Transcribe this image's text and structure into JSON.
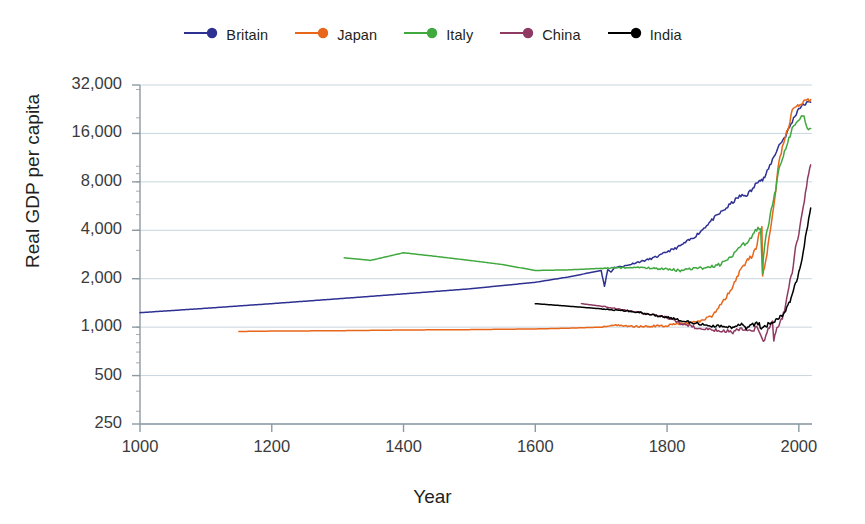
{
  "chart_data": {
    "type": "line",
    "title": "",
    "xlabel": "Year",
    "ylabel": "Real GDP per capita",
    "xlim": [
      1000,
      2020
    ],
    "ylim": [
      250,
      32000
    ],
    "yscale": "log",
    "xticks": [
      1000,
      1200,
      1400,
      1600,
      1800,
      2000
    ],
    "xtick_labels": [
      "1000",
      "1200",
      "1400",
      "1600",
      "1800",
      "2000"
    ],
    "yticks": [
      250,
      500,
      1000,
      2000,
      4000,
      8000,
      16000,
      32000
    ],
    "ytick_labels": [
      "250",
      "500",
      "1,000",
      "2,000",
      "4,000",
      "8,000",
      "16,000",
      "32,000"
    ],
    "grid": "horizontal-only",
    "legend_position": "top-center",
    "background": "#ffffff",
    "gridline_color": "#c9d6de",
    "axis_color": "#8d9aa3",
    "series": [
      {
        "name": "Britain",
        "color": "#2e3192",
        "x": [
          1000,
          1100,
          1200,
          1300,
          1400,
          1500,
          1600,
          1650,
          1700,
          1705,
          1710,
          1715,
          1720,
          1730,
          1740,
          1750,
          1760,
          1770,
          1780,
          1790,
          1800,
          1810,
          1820,
          1830,
          1840,
          1850,
          1860,
          1870,
          1880,
          1890,
          1900,
          1910,
          1920,
          1930,
          1940,
          1945,
          1950,
          1960,
          1970,
          1980,
          1990,
          2000,
          2010,
          2018
        ],
        "y": [
          1230,
          1310,
          1400,
          1500,
          1610,
          1730,
          1900,
          2050,
          2250,
          1800,
          2280,
          2200,
          2350,
          2380,
          2420,
          2500,
          2560,
          2620,
          2700,
          2800,
          2950,
          3050,
          3200,
          3400,
          3600,
          3900,
          4300,
          4700,
          5100,
          5500,
          6000,
          6500,
          6600,
          7200,
          8400,
          8200,
          8800,
          11000,
          13500,
          15500,
          19000,
          23000,
          24500,
          25000
        ]
      },
      {
        "name": "Japan",
        "color": "#e8661a",
        "x": [
          1150,
          1200,
          1300,
          1400,
          1500,
          1600,
          1650,
          1700,
          1720,
          1750,
          1800,
          1820,
          1850,
          1870,
          1880,
          1890,
          1900,
          1910,
          1920,
          1930,
          1935,
          1940,
          1944,
          1945,
          1946,
          1950,
          1955,
          1960,
          1965,
          1970,
          1975,
          1980,
          1985,
          1990,
          1995,
          2000,
          2010,
          2018
        ],
        "y": [
          940,
          945,
          950,
          960,
          965,
          975,
          985,
          1000,
          1030,
          1010,
          1020,
          1050,
          1080,
          1180,
          1350,
          1550,
          1800,
          2200,
          2550,
          2800,
          3100,
          3800,
          4100,
          2100,
          2200,
          2600,
          3600,
          5000,
          7200,
          11000,
          13000,
          15500,
          18000,
          22500,
          23500,
          24000,
          25500,
          26000
        ]
      },
      {
        "name": "Italy",
        "color": "#3fa93f",
        "x": [
          1310,
          1350,
          1400,
          1450,
          1500,
          1550,
          1600,
          1650,
          1700,
          1750,
          1800,
          1820,
          1840,
          1860,
          1870,
          1880,
          1890,
          1900,
          1910,
          1920,
          1930,
          1938,
          1942,
          1945,
          1946,
          1950,
          1955,
          1960,
          1965,
          1970,
          1975,
          1980,
          1985,
          1990,
          2000,
          2008,
          2013,
          2018
        ],
        "y": [
          2700,
          2600,
          2900,
          2750,
          2600,
          2450,
          2250,
          2270,
          2320,
          2350,
          2300,
          2250,
          2300,
          2350,
          2400,
          2450,
          2600,
          2800,
          3200,
          3300,
          3700,
          4200,
          4000,
          2100,
          2700,
          3600,
          4500,
          5800,
          7200,
          9500,
          11000,
          13000,
          15000,
          17000,
          19500,
          20500,
          17500,
          17200
        ]
      },
      {
        "name": "China",
        "color": "#8e3a62",
        "x": [
          1670,
          1700,
          1750,
          1800,
          1820,
          1850,
          1870,
          1890,
          1900,
          1913,
          1920,
          1930,
          1936,
          1940,
          1946,
          1950,
          1955,
          1960,
          1962,
          1965,
          1970,
          1975,
          1980,
          1985,
          1990,
          1995,
          2000,
          2005,
          2010,
          2015,
          2018
        ],
        "y": [
          1400,
          1350,
          1250,
          1150,
          1050,
          980,
          960,
          950,
          930,
          980,
          950,
          960,
          1000,
          920,
          800,
          900,
          1000,
          1100,
          830,
          950,
          1050,
          1150,
          1350,
          1800,
          2200,
          3100,
          3800,
          5000,
          6800,
          9000,
          10200
        ]
      },
      {
        "name": "India",
        "color": "#000000",
        "x": [
          1600,
          1650,
          1700,
          1750,
          1800,
          1820,
          1850,
          1870,
          1880,
          1890,
          1900,
          1910,
          1913,
          1920,
          1930,
          1940,
          1943,
          1946,
          1950,
          1955,
          1960,
          1965,
          1970,
          1975,
          1980,
          1985,
          1990,
          1995,
          2000,
          2005,
          2010,
          2015,
          2018
        ],
        "y": [
          1400,
          1350,
          1300,
          1250,
          1150,
          1100,
          1050,
          1020,
          1010,
          1000,
          980,
          1030,
          1050,
          990,
          1030,
          1060,
          960,
          1010,
          1000,
          1060,
          1080,
          1120,
          1150,
          1180,
          1250,
          1400,
          1600,
          1850,
          2200,
          2700,
          3600,
          4700,
          5500
        ]
      }
    ]
  },
  "legend": {
    "items": [
      {
        "label": "Britain",
        "color": "#2e3192"
      },
      {
        "label": "Japan",
        "color": "#e8661a"
      },
      {
        "label": "Italy",
        "color": "#3fa93f"
      },
      {
        "label": "China",
        "color": "#8e3a62"
      },
      {
        "label": "India",
        "color": "#000000"
      }
    ]
  }
}
